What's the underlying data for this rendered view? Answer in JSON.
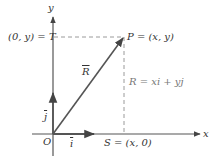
{
  "diagram": {
    "axes": {
      "x_label": "x",
      "y_label": "y",
      "origin_label": "O"
    },
    "points": {
      "T_label": "(0, y) = T",
      "P_label": "P = (x, y)",
      "S_label": "S = (x, 0)"
    },
    "vectors": {
      "R_label": "R",
      "i_label": "i",
      "j_label": "j",
      "equation": "R = xi + yj"
    },
    "colors": {
      "axis": "#555555",
      "vector": "#555555",
      "dashed": "#9a9a9a",
      "text": "#333333",
      "background": "#ffffff"
    }
  }
}
